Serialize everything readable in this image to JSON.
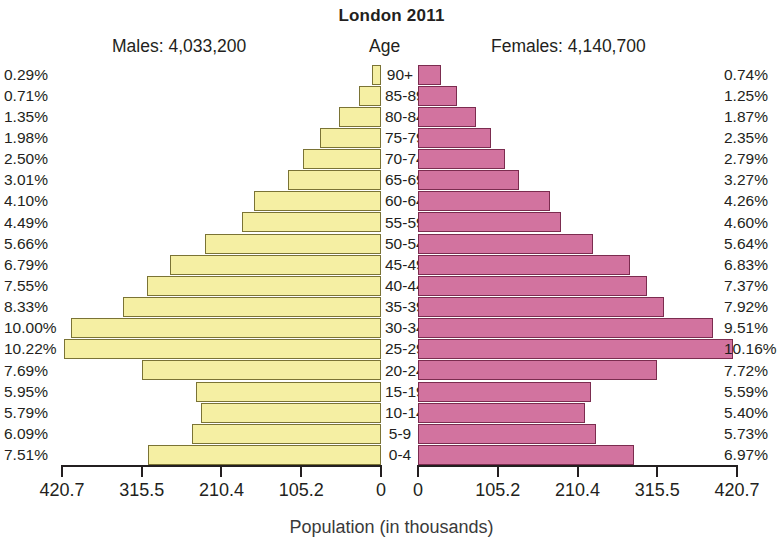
{
  "chart_data": {
    "type": "bar",
    "subtype": "population-pyramid",
    "title": "London 2011",
    "xlabel": "Population (in thousands)",
    "ylabel": "Age",
    "grid": false,
    "legend_position": "none",
    "axis_max": 420.7,
    "axis_unit": "thousands",
    "left_header": "Males: 4,033,200",
    "right_header": "Females: 4,140,700",
    "center_header": "Age",
    "male_total": "4,033,200",
    "female_total": "4,140,700",
    "left_tick_labels": [
      "420.7",
      "315.5",
      "210.4",
      "105.2",
      "0"
    ],
    "right_tick_labels": [
      "0",
      "105.2",
      "210.4",
      "315.5",
      "420.7"
    ],
    "tick_values": [
      0,
      105.2,
      210.4,
      315.5,
      420.7
    ],
    "categories": [
      "90+",
      "85-89",
      "80-84",
      "75-79",
      "70-74",
      "65-69",
      "60-64",
      "55-59",
      "50-54",
      "45-49",
      "40-44",
      "35-39",
      "30-34",
      "25-29",
      "20-24",
      "15-19",
      "10-14",
      "5-9",
      "0-4"
    ],
    "series": [
      {
        "name": "Males",
        "color": "#f5efa3",
        "border_color": "#7a7335",
        "side": "left",
        "unit": "percent",
        "labels": [
          "0.29%",
          "0.71%",
          "1.35%",
          "1.98%",
          "2.50%",
          "3.01%",
          "4.10%",
          "4.49%",
          "5.66%",
          "6.79%",
          "7.55%",
          "8.33%",
          "10.00%",
          "10.22%",
          "7.69%",
          "5.95%",
          "5.79%",
          "6.09%",
          "7.51%"
        ],
        "values": [
          0.29,
          0.71,
          1.35,
          1.98,
          2.5,
          3.01,
          4.1,
          4.49,
          5.66,
          6.79,
          7.55,
          8.33,
          10.0,
          10.22,
          7.69,
          5.95,
          5.79,
          6.09,
          7.51
        ]
      },
      {
        "name": "Females",
        "color": "#d2739f",
        "border_color": "#7b2c4f",
        "side": "right",
        "unit": "percent",
        "labels": [
          "0.74%",
          "1.25%",
          "1.87%",
          "2.35%",
          "2.79%",
          "3.27%",
          "4.26%",
          "4.60%",
          "5.64%",
          "6.83%",
          "7.37%",
          "7.92%",
          "9.51%",
          "10.16%",
          "7.72%",
          "5.59%",
          "5.40%",
          "5.73%",
          "6.97%"
        ],
        "values": [
          0.74,
          1.25,
          1.87,
          2.35,
          2.79,
          3.27,
          4.26,
          4.6,
          5.64,
          6.83,
          7.37,
          7.92,
          9.51,
          10.16,
          7.72,
          5.59,
          5.4,
          5.73,
          6.97
        ]
      }
    ]
  }
}
